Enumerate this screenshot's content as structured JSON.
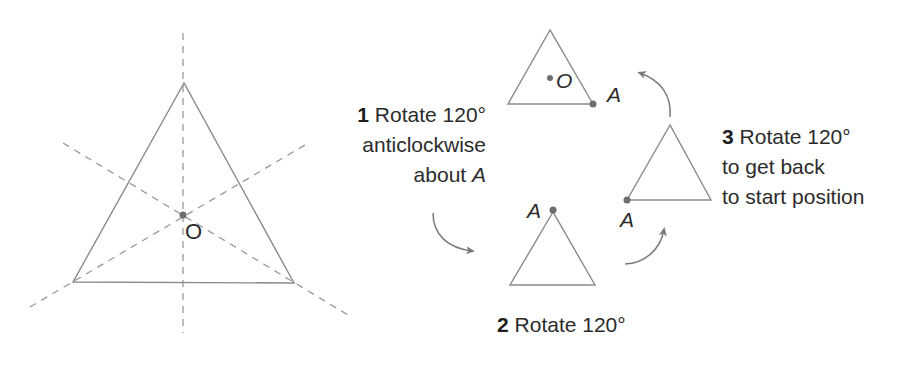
{
  "colors": {
    "line": "#8a8a8a",
    "dashed": "#9a9a9a",
    "dot": "#6e6e6e",
    "text": "#2b2b2b",
    "arrow": "#7a7a7a",
    "background": "#ffffff"
  },
  "left_figure": {
    "center_label": "O",
    "edge_glyph": ")"
  },
  "top_triangle": {
    "center_label": "O",
    "vertex_label": "A"
  },
  "bottom_triangle": {
    "vertex_label": "A"
  },
  "right_triangle": {
    "vertex_label": "A"
  },
  "arrow_label_top": "A",
  "steps": [
    {
      "number": "1",
      "lines": [
        "Rotate 120°",
        "anticlockwise",
        "about "
      ],
      "italic_tail": "A"
    },
    {
      "number": "2",
      "lines": [
        "Rotate 120°"
      ]
    },
    {
      "number": "3",
      "lines": [
        "Rotate 120°",
        "to get back",
        "to start position"
      ]
    }
  ]
}
